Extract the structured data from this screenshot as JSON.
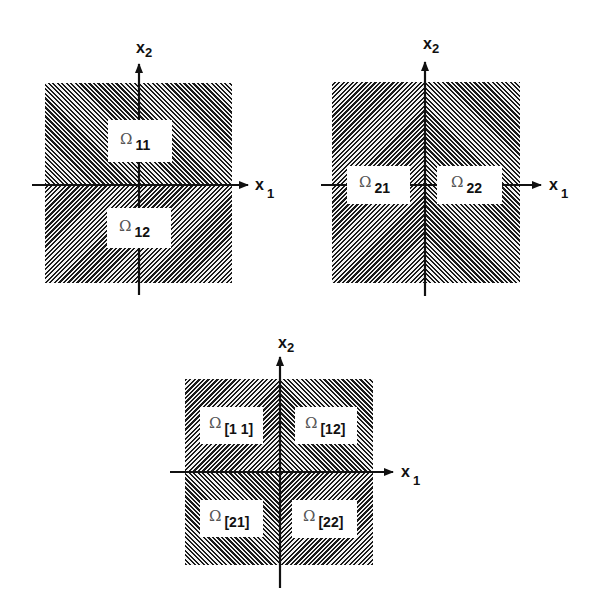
{
  "diagrams": [
    {
      "id": "partition-horizontal",
      "axes": {
        "x1_label": "x",
        "x1_sub": "1",
        "x2_label": "x",
        "x2_sub": "2"
      },
      "regions": [
        {
          "symbol": "Ω",
          "subscript": "11"
        },
        {
          "symbol": "Ω",
          "subscript": "12"
        }
      ],
      "hatching": {
        "top": "/",
        "bottom": "\\"
      }
    },
    {
      "id": "partition-vertical",
      "axes": {
        "x1_label": "x",
        "x1_sub": "1",
        "x2_label": "x",
        "x2_sub": "2"
      },
      "regions": [
        {
          "symbol": "Ω",
          "subscript": "21"
        },
        {
          "symbol": "Ω",
          "subscript": "22"
        }
      ],
      "hatching": {
        "left": "\\",
        "right": "/"
      }
    },
    {
      "id": "partition-quadrants",
      "axes": {
        "x1_label": "x",
        "x1_sub": "1",
        "x2_label": "x",
        "x2_sub": "2"
      },
      "regions": [
        {
          "symbol": "Ω",
          "subscript": "[1 1]"
        },
        {
          "symbol": "Ω",
          "subscript": "[12]"
        },
        {
          "symbol": "Ω",
          "subscript": "[21]"
        },
        {
          "symbol": "Ω",
          "subscript": "[22]"
        }
      ],
      "hatching": {
        "top_left": "\\",
        "top_right": "/",
        "bottom_left": "/",
        "bottom_right": "\\"
      }
    }
  ],
  "colors": {
    "ink": "#111111",
    "hatch": "#1a1a1a",
    "background": "#ffffff"
  }
}
